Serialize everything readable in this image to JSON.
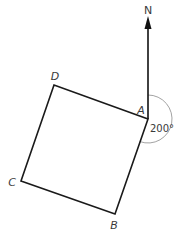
{
  "diagram": {
    "type": "bearing-diagram",
    "north_label": "N",
    "vertices": [
      {
        "id": "A",
        "label": "A",
        "x": 148,
        "y": 119
      },
      {
        "id": "B",
        "label": "B",
        "x": 115,
        "y": 214
      },
      {
        "id": "C",
        "label": "C",
        "x": 21,
        "y": 181
      },
      {
        "id": "D",
        "label": "D",
        "x": 54,
        "y": 85
      }
    ],
    "shape": "square ABCD",
    "bearing": {
      "from": "A",
      "to": "B",
      "value_label": "200°",
      "degrees": 200
    },
    "colors": {
      "stroke": "#1a1a1a",
      "arc": "#8a8a8a",
      "text": "#3a3a3a"
    }
  }
}
